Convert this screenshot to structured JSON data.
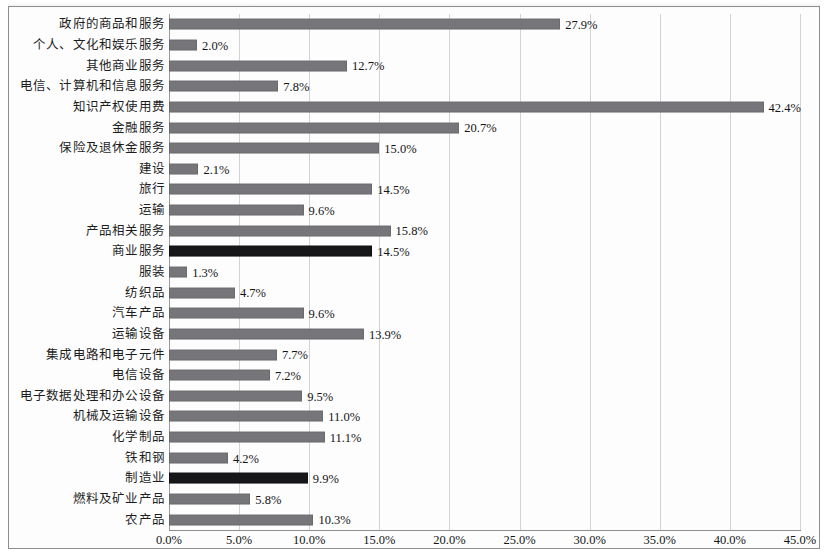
{
  "chart_data": {
    "type": "bar",
    "orientation": "horizontal",
    "title": "",
    "subtitle": "",
    "xlabel": "",
    "ylabel": "",
    "xlim": [
      0,
      45
    ],
    "x_tick_step": 5,
    "x_tick_labels": [
      "0.0%",
      "5.0%",
      "10.0%",
      "15.0%",
      "20.0%",
      "25.0%",
      "30.0%",
      "35.0%",
      "40.0%",
      "45.0%"
    ],
    "x_tick_values": [
      0,
      5,
      10,
      15,
      20,
      25,
      30,
      35,
      40,
      45
    ],
    "grid": "vertical",
    "legend": "none",
    "value_label_suffix": "%",
    "colors": {
      "bar_default": "#76767a",
      "bar_highlight": "#17171a",
      "gridline": "#d3d3d3",
      "axis": "#8e8e8e",
      "text": "#141414",
      "background": "#fdfdfd",
      "frame": "#8e8e8e"
    },
    "categories": [
      "政府的商品和服务",
      "个人、文化和娱乐服务",
      "其他商业服务",
      "电信、计算机和信息服务",
      "知识产权使用费",
      "金融服务",
      "保险及退休金服务",
      "建设",
      "旅行",
      "运输",
      "产品相关服务",
      "商业服务",
      "服装",
      "纺织品",
      "汽车产品",
      "运输设备",
      "集成电路和电子元件",
      "电信设备",
      "电子数据处理和办公设备",
      "机械及运输设备",
      "化学制品",
      "铁和钢",
      "制造业",
      "燃料及矿业产品",
      "农产品"
    ],
    "values": [
      27.9,
      2.0,
      12.7,
      7.8,
      42.4,
      20.7,
      15.0,
      2.1,
      14.5,
      9.6,
      15.8,
      14.5,
      1.3,
      4.7,
      9.6,
      13.9,
      7.7,
      7.2,
      9.5,
      11.0,
      11.1,
      4.2,
      9.9,
      5.8,
      10.3
    ],
    "value_labels": [
      "27.9%",
      "2.0%",
      "12.7%",
      "7.8%",
      "42.4%",
      "20.7%",
      "15.0%",
      "2.1%",
      "14.5%",
      "9.6%",
      "15.8%",
      "14.5%",
      "1.3%",
      "4.7%",
      "9.6%",
      "13.9%",
      "7.7%",
      "7.2%",
      "9.5%",
      "11.0%",
      "11.1%",
      "4.2%",
      "9.9%",
      "5.8%",
      "10.3%"
    ],
    "highlighted": [
      false,
      false,
      false,
      false,
      false,
      false,
      false,
      false,
      false,
      false,
      false,
      true,
      false,
      false,
      false,
      false,
      false,
      false,
      false,
      false,
      false,
      false,
      true,
      false,
      false
    ]
  }
}
